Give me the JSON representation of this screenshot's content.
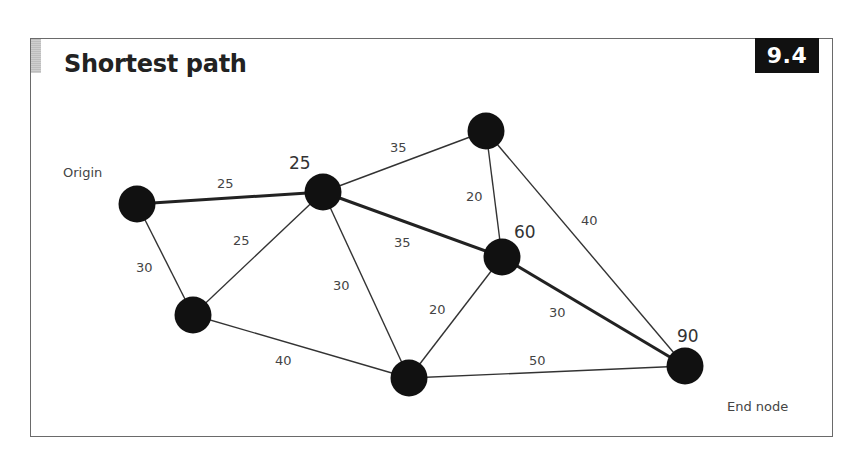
{
  "header": {
    "title": "Shortest path",
    "figure_number": "9.4"
  },
  "labels": {
    "origin": "Origin",
    "end_node": "End node"
  },
  "colors": {
    "node": "#111111",
    "edge": "#333333",
    "shortest_path": "#222222",
    "badge_bg": "#111111",
    "badge_text": "#ffffff",
    "frame": "#6a6a6a"
  },
  "nodes": [
    {
      "id": "origin",
      "x": 137,
      "y": 204,
      "distance_label": ""
    },
    {
      "id": "n25",
      "x": 323,
      "y": 192,
      "distance_label": "25"
    },
    {
      "id": "top",
      "x": 486,
      "y": 131,
      "distance_label": ""
    },
    {
      "id": "n60",
      "x": 502,
      "y": 257,
      "distance_label": "60"
    },
    {
      "id": "bottom-left",
      "x": 193,
      "y": 315,
      "distance_label": ""
    },
    {
      "id": "bottom",
      "x": 409,
      "y": 378,
      "distance_label": ""
    },
    {
      "id": "end",
      "x": 685,
      "y": 366,
      "distance_label": "90"
    }
  ],
  "edges": [
    {
      "from": "origin",
      "to": "n25",
      "weight": "25",
      "on_shortest_path": true
    },
    {
      "from": "origin",
      "to": "bottom-left",
      "weight": "30",
      "on_shortest_path": false
    },
    {
      "from": "bottom-left",
      "to": "n25",
      "weight": "25",
      "on_shortest_path": false
    },
    {
      "from": "n25",
      "to": "top",
      "weight": "35",
      "on_shortest_path": false
    },
    {
      "from": "n25",
      "to": "n60",
      "weight": "35",
      "on_shortest_path": true
    },
    {
      "from": "n25",
      "to": "bottom",
      "weight": "30",
      "on_shortest_path": false
    },
    {
      "from": "top",
      "to": "n60",
      "weight": "20",
      "on_shortest_path": false
    },
    {
      "from": "top",
      "to": "end",
      "weight": "40",
      "on_shortest_path": false
    },
    {
      "from": "n60",
      "to": "bottom",
      "weight": "20",
      "on_shortest_path": false
    },
    {
      "from": "n60",
      "to": "end",
      "weight": "30",
      "on_shortest_path": true
    },
    {
      "from": "bottom-left",
      "to": "bottom",
      "weight": "40",
      "on_shortest_path": false
    },
    {
      "from": "bottom",
      "to": "end",
      "weight": "50",
      "on_shortest_path": false
    }
  ],
  "edge_labels": {
    "origin_n25": "25",
    "origin_bottomleft": "30",
    "bottomleft_n25": "25",
    "n25_top": "35",
    "n25_n60": "35",
    "n25_bottom": "30",
    "top_n60": "20",
    "top_end": "40",
    "n60_bottom": "20",
    "n60_end": "30",
    "bottomleft_bottom": "40",
    "bottom_end": "50"
  },
  "distance_labels": {
    "n25": "25",
    "n60": "60",
    "end": "90"
  }
}
